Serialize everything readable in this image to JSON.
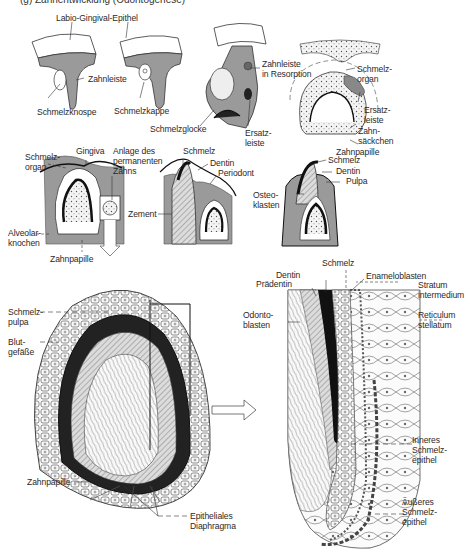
{
  "figure": {
    "header_cut": "(g) Zahnentwicklung (Odontogenese)",
    "stage_row_1": {
      "labels": {
        "labio_gingival_epithel": "Labio-Gingival-Epithel",
        "zahnleiste": "Zahnleiste",
        "schmelzknospe": "Schmelzknospe",
        "schmelzkappe": "Schmelzkappe",
        "schmelzglocke": "Schmelzglocke",
        "zahnleiste_resorption": "Zahnleiste\nin Resorption",
        "ersatzleiste_1": "Ersatz-\nleiste",
        "schmelzorgan_1": "Schmelz-\norgan",
        "ersatzleiste_2": "Ersatz-\nleiste",
        "zahnsaeckchen": "Zahn-\nsäckchen",
        "zahnpapille_1": "Zahnpapille"
      }
    },
    "stage_row_2": {
      "labels": {
        "schmelzorgan_2": "Schmelz-\norgan",
        "gingiva": "Gingiva",
        "anlage": "Anlage des\npermanenten\nZahns",
        "schmelz_1": "Schmelz",
        "dentin_1": "Dentin",
        "periodont": "Periodont",
        "zement": "Zement",
        "alveolarknochen": "Alveolar-\nknochen",
        "zahnpapille_2": "Zahnpapille",
        "schmelz_2": "Schmelz",
        "dentin_2": "Dentin",
        "pulpa": "Pulpa",
        "osteoklasten": "Osteo-\nklasten"
      }
    },
    "bell_stage": {
      "labels": {
        "schmelzpulpa": "Schmelz-\npulpa",
        "blutgefaesse": "Blut-\ngefäße",
        "zahnpapille_3": "Zahnpapille",
        "epitheliales_diaphragma": "Epitheliales\nDiaphragma"
      }
    },
    "detail": {
      "labels": {
        "schmelz_3": "Schmelz",
        "dentin_3": "Dentin",
        "praedentin": "Prädentin",
        "enameloblasten": "Enameloblasten",
        "stratum": "Stratum\nintermedium",
        "odontoblasten": "Odonto-\nblasten",
        "reticulum": "Reticulum\nstellatum",
        "inneres": "Inneres\nSchmelz-\nepithel",
        "aeusseres": "Äußeres\nSchmelz-\nepithel"
      }
    },
    "colors": {
      "tissue_gray": "#9a9a9a",
      "dark": "#111111",
      "line": "#333333",
      "light_fill": "#e9e9e9"
    }
  }
}
